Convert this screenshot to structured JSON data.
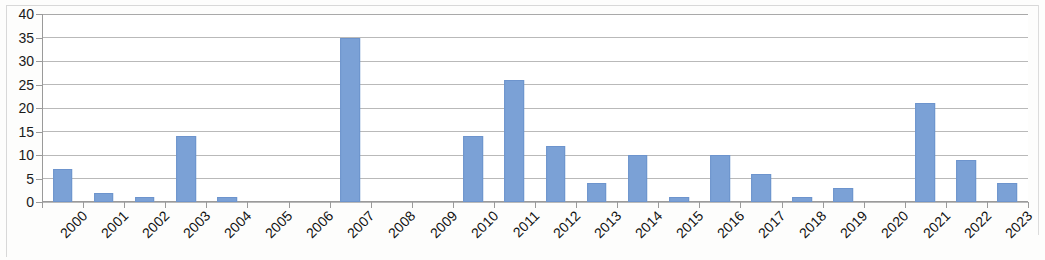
{
  "chart_data": {
    "type": "bar",
    "title": "",
    "subtitle": "",
    "xlabel": "",
    "ylabel": "",
    "ylim": [
      0,
      40
    ],
    "ytick_step": 5,
    "yticks": [
      0,
      5,
      10,
      15,
      20,
      25,
      30,
      35,
      40
    ],
    "ytick_labels": [
      "0",
      "5",
      "10",
      "15",
      "20",
      "25",
      "30",
      "35",
      "40"
    ],
    "grid": true,
    "grid_axis": "y",
    "legend": false,
    "legend_position": "none",
    "bar_color": "#7ba1d6",
    "bar_edge_color": "#6d94cd",
    "gridline_color": "#b9b9b9",
    "axis_color": "#9a9a9a",
    "label_rotation_degrees": -45,
    "categories": [
      "2000",
      "2001",
      "2002",
      "2003",
      "2004",
      "2005",
      "2006",
      "2007",
      "2008",
      "2009",
      "2010",
      "2011",
      "2012",
      "2013",
      "2014",
      "2015",
      "2016",
      "2017",
      "2018",
      "2019",
      "2020",
      "2021",
      "2022",
      "2023"
    ],
    "values": [
      7,
      2,
      1,
      14,
      1,
      0,
      0,
      35,
      0,
      0,
      14,
      26,
      12,
      4,
      10,
      1,
      10,
      6,
      1,
      3,
      0,
      21,
      9,
      4
    ]
  }
}
